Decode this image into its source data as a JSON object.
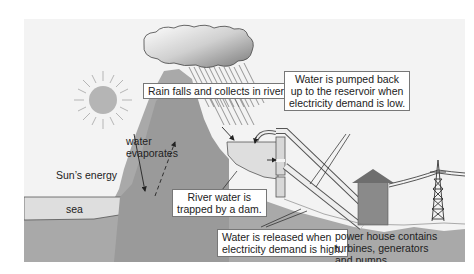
{
  "diagram": {
    "labels": {
      "rain": "Rain falls and collects in rivers.",
      "pumped_line1": "Water is pumped back",
      "pumped_line2": "up to the reservoir when",
      "pumped_line3": "electricity demand is low.",
      "evaporates_line1": "water",
      "evaporates_line2": "evaporates",
      "sun_energy": "Sun’s energy",
      "sea": "sea",
      "dam_line1": "River water is",
      "dam_line2": "trapped by a dam.",
      "released_line1": "Water is released when",
      "released_line2": "electricity demand is high.",
      "powerhouse_line1": "power house contains",
      "powerhouse_line2": "turbines, generators",
      "powerhouse_line3": "and pumps"
    },
    "colors": {
      "background": "#f3f3f3",
      "ground": "#a9a9a9",
      "mountain": "#9a9a9a",
      "water": "#dcdcdc",
      "sun": "#b5b5b5",
      "house_wall": "#8a8a8a",
      "house_roof": "#6e6e6e",
      "cloud_dark": "#8c8c8c"
    }
  }
}
